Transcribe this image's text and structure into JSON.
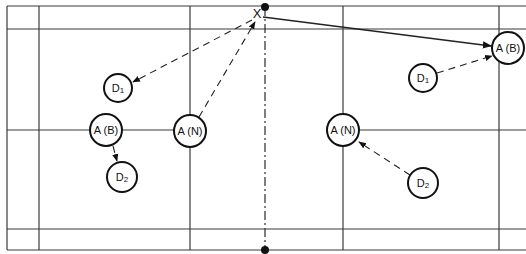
{
  "diagram": {
    "type": "badminton-doubles-court-positions",
    "shuttle_mark": "X",
    "players": [
      {
        "id": "D1_left",
        "label": "D",
        "sub": "1",
        "side": "left"
      },
      {
        "id": "AB_left",
        "label": "A (B)",
        "sub": "",
        "side": "left"
      },
      {
        "id": "AN_left",
        "label": "A (N)",
        "sub": "",
        "side": "left"
      },
      {
        "id": "D2_left",
        "label": "D",
        "sub": "2",
        "side": "left"
      },
      {
        "id": "AB_right",
        "label": "A (B)",
        "sub": "",
        "side": "right"
      },
      {
        "id": "D1_right",
        "label": "D",
        "sub": "1",
        "side": "right"
      },
      {
        "id": "AN_right",
        "label": "A (N)",
        "sub": "",
        "side": "right"
      },
      {
        "id": "D2_right",
        "label": "D",
        "sub": "2",
        "side": "right"
      }
    ],
    "arrows": [
      {
        "from": "X",
        "to": "D1_left",
        "style": "dashed"
      },
      {
        "from": "AN_left",
        "to": "X",
        "style": "dashed"
      },
      {
        "from": "AB_left",
        "to": "D2_left",
        "style": "dashed"
      },
      {
        "from": "X",
        "to": "AB_right",
        "style": "solid"
      },
      {
        "from": "D1_right",
        "to": "AB_right",
        "style": "dashed"
      },
      {
        "from": "D2_right",
        "to": "AN_right",
        "style": "dashed"
      }
    ]
  }
}
